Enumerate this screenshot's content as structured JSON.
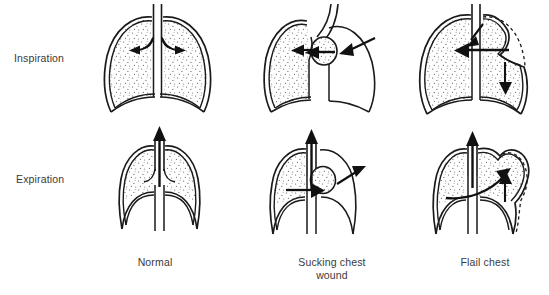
{
  "figure": {
    "background_color": "#ffffff",
    "ink_color": "#1a1a1a",
    "text_color": "#3a3a3a",
    "stipple_color": "#555555"
  },
  "rows": [
    {
      "key": "inspiration",
      "label": "Inspiration"
    },
    {
      "key": "expiration",
      "label": "Expiration"
    }
  ],
  "columns": [
    {
      "key": "normal",
      "caption_line1": "Normal",
      "caption_line2": ""
    },
    {
      "key": "sucking",
      "caption_line1": "Sucking chest",
      "caption_line2": "wound"
    },
    {
      "key": "flail",
      "caption_line1": "Flail chest",
      "caption_line2": ""
    }
  ],
  "panels": {
    "normal_inspiration": {
      "name": "Normal inspiration",
      "lung_fill": "stippled",
      "left_lung_aerated": true,
      "right_lung_aerated": true,
      "diaphragm": "flattened-descended",
      "arrows": [
        {
          "name": "air-into-left-lung",
          "direction": "down-left",
          "meaning": "air flows into left lung"
        },
        {
          "name": "air-into-right-lung",
          "direction": "down-right",
          "meaning": "air flows into right lung"
        }
      ]
    },
    "sucking_inspiration": {
      "name": "Sucking chest wound, inspiration",
      "lung_fill": "stippled",
      "left_lung_aerated": true,
      "right_lung_aerated": false,
      "wound_side": "right",
      "mediastinal_shift": "left",
      "arrows": [
        {
          "name": "air-entering-wound",
          "direction": "left",
          "meaning": "air sucked in through chest wall defect"
        },
        {
          "name": "mediastinal-shift-arrow-outer",
          "direction": "left",
          "meaning": "mediastinum pushed toward uninjured side"
        },
        {
          "name": "mediastinal-shift-arrow-inner",
          "direction": "left",
          "meaning": "mediastinum pushed toward uninjured side"
        }
      ]
    },
    "flail_inspiration": {
      "name": "Flail chest, inspiration",
      "lung_fill": "stippled",
      "left_lung_aerated": true,
      "right_lung_aerated": true,
      "flail_segment_side": "right",
      "flail_segment_motion": "paradoxical inward collapse",
      "dashed_outline": "normal chest wall position",
      "arrows": [
        {
          "name": "pendelluft-arrow",
          "direction": "left",
          "meaning": "air shifts from flail side to opposite lung"
        },
        {
          "name": "tracheal-airflow-arrow",
          "direction": "down-left",
          "meaning": "inspired air down trachea"
        },
        {
          "name": "flail-segment-inward-arrow",
          "direction": "down",
          "meaning": "flail segment moves inward"
        }
      ]
    },
    "normal_expiration": {
      "name": "Normal expiration",
      "lung_fill": "stippled",
      "left_lung_aerated": true,
      "right_lung_aerated": true,
      "diaphragm": "raised-domed",
      "arrows": [
        {
          "name": "air-out-trachea",
          "direction": "up",
          "meaning": "air expelled up the trachea"
        }
      ]
    },
    "sucking_expiration": {
      "name": "Sucking chest wound, expiration",
      "lung_fill": "stippled",
      "left_lung_aerated": true,
      "right_lung_aerated": false,
      "wound_side": "right",
      "mediastinal_shift": "right",
      "arrows": [
        {
          "name": "air-out-trachea",
          "direction": "up",
          "meaning": "air expelled up the trachea"
        },
        {
          "name": "mediastinal-return-arrow",
          "direction": "right",
          "meaning": "mediastinum swings back toward injured side"
        },
        {
          "name": "air-leaving-wound",
          "direction": "up-right",
          "meaning": "air escapes through chest wall defect"
        }
      ]
    },
    "flail_expiration": {
      "name": "Flail chest, expiration",
      "lung_fill": "stippled",
      "left_lung_aerated": true,
      "right_lung_aerated": true,
      "flail_segment_side": "right",
      "flail_segment_motion": "paradoxical outward bulge",
      "dashed_outline": "normal chest wall position",
      "arrows": [
        {
          "name": "air-out-trachea",
          "direction": "up",
          "meaning": "air expelled up the trachea"
        },
        {
          "name": "pendelluft-return-arrow",
          "direction": "up-right",
          "meaning": "air shifts back into flail side"
        },
        {
          "name": "flail-segment-outward-arrow",
          "direction": "up",
          "meaning": "flail segment bulges outward"
        }
      ]
    }
  }
}
